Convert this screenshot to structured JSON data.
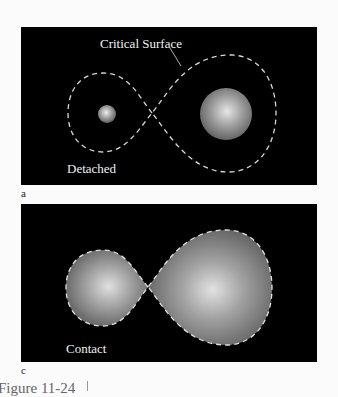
{
  "figure": {
    "caption": "Figure 11-24",
    "panels": [
      {
        "id": "a",
        "sublabel": "a",
        "state_label": "Detached",
        "annotation": "Critical Surface",
        "description": "Two separate stars each well inside its own lobe of a figure-eight dashed critical surface"
      },
      {
        "id": "c",
        "sublabel": "c",
        "state_label": "Contact",
        "description": "Two stars each filling their lobe of the dashed critical surface, touching at the crossing point"
      }
    ]
  },
  "colors": {
    "panel_bg": "#000000",
    "dash": "#d8d8d8",
    "star_center": "#e8e8e8",
    "star_edge": "#6a6a6a",
    "page_bg": "#fbfbfb"
  }
}
